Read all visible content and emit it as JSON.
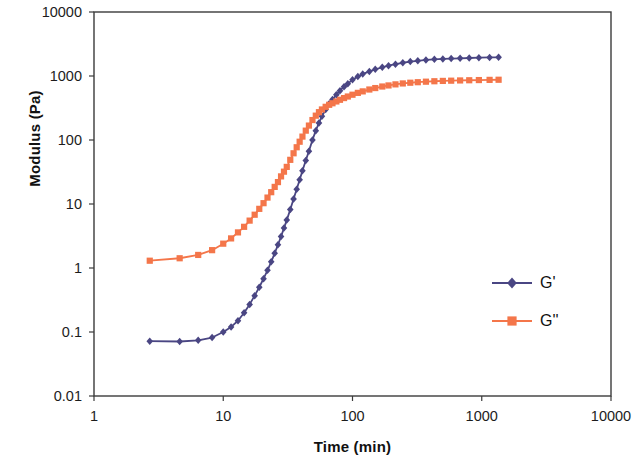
{
  "chart_data": {
    "type": "line",
    "title": "",
    "xlabel": "Time (min)",
    "ylabel": "Modulus (Pa)",
    "xscale": "log",
    "yscale": "log",
    "xlim": [
      1,
      10000
    ],
    "ylim": [
      0.01,
      10000
    ],
    "xticks": [
      "1",
      "10",
      "100",
      "1000",
      "10000"
    ],
    "xtick_values": [
      1,
      10,
      100,
      1000,
      10000
    ],
    "yticks": [
      "0.01",
      "0.1",
      "1",
      "10",
      "100",
      "1000",
      "10000"
    ],
    "ytick_values": [
      0.01,
      0.1,
      1,
      10,
      100,
      1000,
      10000
    ],
    "grid": false,
    "legend_position": "center-right-inside",
    "crossover": {
      "x": 70,
      "y": 350
    },
    "series": [
      {
        "name": "G'",
        "color": "#4a4683",
        "marker": "diamond",
        "x": [
          2.7,
          4.6,
          6.4,
          8.2,
          10.0,
          11.5,
          13.0,
          14.5,
          16.0,
          17.5,
          19.0,
          20.5,
          22.0,
          23.5,
          25.0,
          26.5,
          28.0,
          29.5,
          31.0,
          33.0,
          35.0,
          37.0,
          39.0,
          41.0,
          43.5,
          46.0,
          49.0,
          52.0,
          55.0,
          58.0,
          62.0,
          66.0,
          70.0,
          75.0,
          80.0,
          86.0,
          92.0,
          100.0,
          110.0,
          120.0,
          135.0,
          150.0,
          170.0,
          190.0,
          215.0,
          245.0,
          280.0,
          320.0,
          370.0,
          430.0,
          500.0,
          580.0,
          680.0,
          800.0,
          950.0,
          1150.0,
          1350.0
        ],
        "y": [
          0.072,
          0.071,
          0.074,
          0.082,
          0.1,
          0.12,
          0.15,
          0.2,
          0.27,
          0.37,
          0.5,
          0.68,
          0.92,
          1.25,
          1.7,
          2.3,
          3.1,
          4.2,
          5.6,
          8.2,
          12.0,
          17.0,
          24.0,
          33.0,
          48.0,
          67.0,
          100.0,
          140.0,
          185.0,
          235.0,
          300.0,
          370.0,
          430.0,
          510.0,
          590.0,
          680.0,
          760.0,
          870.0,
          980.0,
          1070.0,
          1180.0,
          1270.0,
          1370.0,
          1450.0,
          1530.0,
          1610.0,
          1680.0,
          1730.0,
          1780.0,
          1820.0,
          1850.0,
          1870.0,
          1890.0,
          1910.0,
          1930.0,
          1950.0,
          1960.0
        ]
      },
      {
        "name": "G''",
        "color": "#f4764a",
        "marker": "square",
        "x": [
          2.7,
          4.6,
          6.4,
          8.2,
          10.0,
          11.5,
          13.0,
          14.5,
          16.0,
          17.5,
          19.0,
          20.5,
          22.0,
          23.5,
          25.0,
          26.5,
          28.0,
          29.5,
          31.0,
          33.0,
          35.0,
          37.0,
          39.0,
          41.0,
          43.5,
          46.0,
          49.0,
          52.0,
          55.0,
          58.0,
          62.0,
          66.0,
          70.0,
          75.0,
          80.0,
          86.0,
          92.0,
          100.0,
          110.0,
          120.0,
          135.0,
          150.0,
          170.0,
          190.0,
          215.0,
          245.0,
          280.0,
          320.0,
          370.0,
          430.0,
          500.0,
          580.0,
          680.0,
          800.0,
          950.0,
          1150.0,
          1350.0
        ],
        "y": [
          1.3,
          1.42,
          1.6,
          1.9,
          2.4,
          2.9,
          3.6,
          4.4,
          5.5,
          6.8,
          8.4,
          10.3,
          12.6,
          15.3,
          18.5,
          22.0,
          27.0,
          32.0,
          38.0,
          49.0,
          62.0,
          77.0,
          94.0,
          113.0,
          140.0,
          168.0,
          205.0,
          240.0,
          272.0,
          300.0,
          330.0,
          355.0,
          375.0,
          400.0,
          425.0,
          452.0,
          478.0,
          510.0,
          545.0,
          575.0,
          615.0,
          648.0,
          685.0,
          712.0,
          740.0,
          765.0,
          785.0,
          800.0,
          815.0,
          828.0,
          838.0,
          845.0,
          852.0,
          858.0,
          864.0,
          870.0,
          874.0
        ]
      }
    ]
  },
  "legend": {
    "items": [
      {
        "label": "G'",
        "color": "#4a4683"
      },
      {
        "label": "G''",
        "color": "#f4764a"
      }
    ]
  },
  "axes": {
    "x_title": "Time (min)",
    "y_title": "Modulus (Pa)"
  }
}
